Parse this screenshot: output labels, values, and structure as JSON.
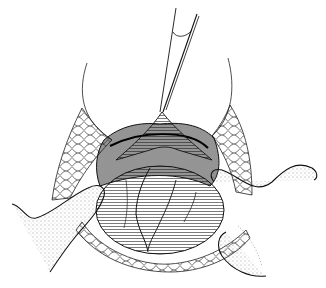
{
  "illustration": {
    "type": "surgical line drawing",
    "subject": "open surgical field with retracted incision, forceps lifting tissue, fingers retracting wound edges",
    "style": "black ink on white, stippling and hatching",
    "colors": {
      "background": "#ffffff",
      "ink": "#111111",
      "shade": "#2a2a2a"
    },
    "elements": [
      "forceps",
      "left-retractor-blade",
      "right-retractor-blade",
      "left-fat-layer",
      "right-fat-layer",
      "lower-fat-layer",
      "central-organ",
      "left-finger",
      "right-finger",
      "lower-right-finger"
    ]
  }
}
